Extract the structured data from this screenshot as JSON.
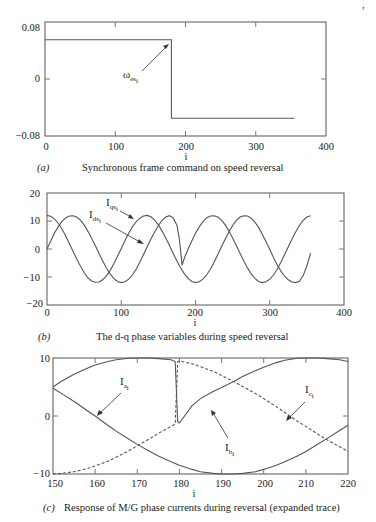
{
  "page_number_mark": ",",
  "charts": [
    {
      "panel": "(a)",
      "caption": "Synchronous frame command on speed reversal",
      "xlabel": "i",
      "xticks": [
        "0",
        "100",
        "200",
        "300",
        "400"
      ],
      "yticks": [
        "0.08",
        "0",
        "−0.08"
      ],
      "annotation": {
        "main": "ω",
        "sub": "es",
        "subsub": "i"
      }
    },
    {
      "panel": "(b)",
      "caption": "The d-q phase variables during speed reversal",
      "xlabel": "i",
      "xticks": [
        "0",
        "100",
        "200",
        "300",
        "400"
      ],
      "yticks": [
        "20",
        "10",
        "0",
        "−10",
        "−20"
      ],
      "annotations": [
        {
          "main": "I",
          "sub": "qs",
          "subsub": "i"
        },
        {
          "main": "I",
          "sub": "ds",
          "subsub": "i"
        }
      ]
    },
    {
      "panel": "(c)",
      "caption": "Response of M/G phase currents during reversal (expanded trace)",
      "xlabel": "i",
      "xticks": [
        "150",
        "160",
        "170",
        "180",
        "190",
        "200",
        "210",
        "220"
      ],
      "yticks": [
        "10",
        "0",
        "−10"
      ],
      "annotations": [
        {
          "main": "I",
          "sub": "a",
          "subsub": "i"
        },
        {
          "main": "I",
          "sub": "b",
          "subsub": "i"
        },
        {
          "main": "I",
          "sub": "c",
          "subsub": "i"
        }
      ]
    }
  ],
  "chart_data": [
    {
      "type": "line",
      "title": "Synchronous frame command on speed reversal",
      "xlabel": "i",
      "ylabel": "",
      "xlim": [
        0,
        400
      ],
      "ylim": [
        -0.08,
        0.08
      ],
      "grid": false,
      "series": [
        {
          "name": "omega_es_i",
          "style": "solid",
          "x": [
            0,
            180,
            180,
            355
          ],
          "y": [
            0.055,
            0.055,
            -0.055,
            -0.055
          ]
        }
      ]
    },
    {
      "type": "line",
      "title": "The d-q phase variables during speed reversal",
      "xlabel": "i",
      "ylabel": "",
      "xlim": [
        0,
        400
      ],
      "ylim": [
        -20,
        20
      ],
      "grid": false,
      "series": [
        {
          "name": "I_qs_i",
          "style": "solid",
          "x": [
            0,
            5,
            10,
            15,
            20,
            25,
            30,
            35,
            40,
            45,
            50,
            55,
            60,
            65,
            70,
            75,
            80,
            85,
            90,
            95,
            100,
            105,
            110,
            115,
            120,
            125,
            130,
            135,
            140,
            145,
            150,
            155,
            160,
            165,
            170,
            175,
            178,
            180,
            182,
            185,
            190,
            195,
            200,
            205,
            210,
            215,
            220,
            225,
            230,
            235,
            240,
            245,
            250,
            255,
            260,
            265,
            270,
            275,
            280,
            285,
            290,
            295,
            300,
            305,
            310,
            315,
            320,
            325,
            330,
            335,
            340,
            345,
            350,
            355
          ],
          "y": [
            0,
            2.9,
            5.6,
            7.9,
            9.8,
            11.1,
            11.8,
            11.9,
            11.4,
            10.3,
            8.6,
            6.4,
            3.9,
            1.2,
            -1.6,
            -4.3,
            -6.8,
            -8.9,
            -10.5,
            -11.6,
            -12,
            -11.7,
            -10.8,
            -9.3,
            -7.2,
            -4.7,
            -2,
            0.8,
            3.6,
            6.1,
            8.4,
            10.2,
            11.4,
            11.9,
            11.1,
            8.5,
            4,
            -1,
            -5.8,
            -3.2,
            0,
            2.9,
            5.6,
            7.9,
            9.8,
            11.1,
            11.8,
            11.9,
            11.4,
            10.3,
            8.6,
            6.4,
            3.9,
            1.2,
            -1.6,
            -4.3,
            -6.8,
            -8.9,
            -10.5,
            -11.6,
            -12,
            -11.7,
            -10.8,
            -9.3,
            -7.2,
            -4.7,
            -2,
            0.8,
            3.6,
            6.1,
            8.4,
            10.2,
            11.4,
            11.9
          ]
        },
        {
          "name": "I_ds_i",
          "style": "solid",
          "x": [
            0,
            5,
            10,
            15,
            20,
            25,
            30,
            35,
            40,
            45,
            50,
            55,
            60,
            65,
            70,
            75,
            80,
            85,
            90,
            95,
            100,
            105,
            110,
            115,
            120,
            125,
            130,
            135,
            140,
            145,
            150,
            155,
            160,
            165,
            170,
            175,
            180,
            185,
            190,
            195,
            200,
            205,
            210,
            215,
            220,
            225,
            230,
            235,
            240,
            245,
            250,
            255,
            260,
            265,
            270,
            275,
            280,
            285,
            290,
            295,
            300,
            305,
            310,
            315,
            320,
            325,
            330,
            335,
            340,
            345,
            350,
            355
          ],
          "y": [
            12,
            11.7,
            10.8,
            9.3,
            7.2,
            4.7,
            2,
            -0.8,
            -3.6,
            -6.1,
            -8.4,
            -10.2,
            -11.4,
            -11.9,
            -11.8,
            -11,
            -9.6,
            -7.7,
            -5.3,
            -2.6,
            0.2,
            3,
            5.6,
            7.9,
            9.7,
            11,
            11.8,
            12,
            11.5,
            10.3,
            8.6,
            6.4,
            3.9,
            1.2,
            -1.6,
            -4.3,
            -6.8,
            -8.9,
            -10.5,
            -11.6,
            -12,
            -11.7,
            -10.8,
            -9.3,
            -7.2,
            -4.7,
            -2,
            0.8,
            3.6,
            6.1,
            8.4,
            10.2,
            11.4,
            11.9,
            11.8,
            11,
            9.6,
            7.7,
            5.3,
            2.6,
            -0.2,
            -3,
            -5.6,
            -7.9,
            -9.7,
            -11,
            -11.8,
            -12,
            -11.5,
            -9.5,
            -6,
            -1.5
          ]
        }
      ]
    },
    {
      "type": "line",
      "title": "Response of M/G phase currents during reversal (expanded trace)",
      "xlabel": "i",
      "ylabel": "",
      "xlim": [
        150,
        220
      ],
      "ylim": [
        -10,
        10
      ],
      "grid": false,
      "series": [
        {
          "name": "I_a_i",
          "style": "solid",
          "x": [
            150,
            152,
            155,
            158,
            160,
            163,
            165,
            168,
            170,
            173,
            175,
            178,
            180,
            183,
            185,
            188,
            190,
            193,
            195,
            198,
            200,
            203,
            205,
            208,
            210,
            213,
            215,
            218,
            220
          ],
          "y": [
            4.8,
            3.9,
            2.5,
            1,
            0,
            -1.6,
            -2.6,
            -4,
            -4.9,
            -6.1,
            -6.9,
            -7.9,
            -8.5,
            -9.2,
            -9.6,
            -9.9,
            -10,
            -10,
            -9.9,
            -9.6,
            -9.2,
            -8.5,
            -7.9,
            -6.9,
            -6.1,
            -4.8,
            -3.9,
            -2.5,
            -1.6
          ]
        },
        {
          "name": "I_b_i",
          "style": "solid",
          "x": [
            150,
            152,
            155,
            158,
            160,
            163,
            165,
            168,
            170,
            173,
            175,
            178,
            179,
            179.6,
            180,
            183,
            185,
            188,
            190,
            193,
            195,
            198,
            200,
            203,
            205,
            208,
            210,
            213,
            215,
            218,
            220
          ],
          "y": [
            5,
            6,
            7.2,
            8.2,
            8.8,
            9.4,
            9.7,
            9.95,
            10,
            10,
            9.9,
            9.7,
            9.4,
            -1,
            -1.2,
            1.8,
            3,
            4.2,
            4.9,
            6,
            6.8,
            7.8,
            8.4,
            9.2,
            9.6,
            9.95,
            10,
            10,
            9.9,
            9.7,
            9.4
          ]
        },
        {
          "name": "I_c_i",
          "style": "dashed",
          "x": [
            150,
            152,
            155,
            158,
            160,
            163,
            165,
            168,
            170,
            173,
            175,
            178,
            179,
            179.6,
            180,
            183,
            185,
            188,
            190,
            193,
            195,
            198,
            200,
            203,
            205,
            208,
            210,
            213,
            215,
            218,
            220
          ],
          "y": [
            -10,
            -9.9,
            -9.6,
            -9.1,
            -8.6,
            -7.8,
            -7.1,
            -6,
            -5.1,
            -3.9,
            -3,
            -1.8,
            -1.4,
            9.4,
            9.5,
            9,
            8.5,
            7.7,
            7,
            5.9,
            5.1,
            3.9,
            3,
            1.6,
            0.6,
            -0.9,
            -1.8,
            -3.2,
            -4.1,
            -5.3,
            -6.1
          ]
        }
      ]
    }
  ]
}
